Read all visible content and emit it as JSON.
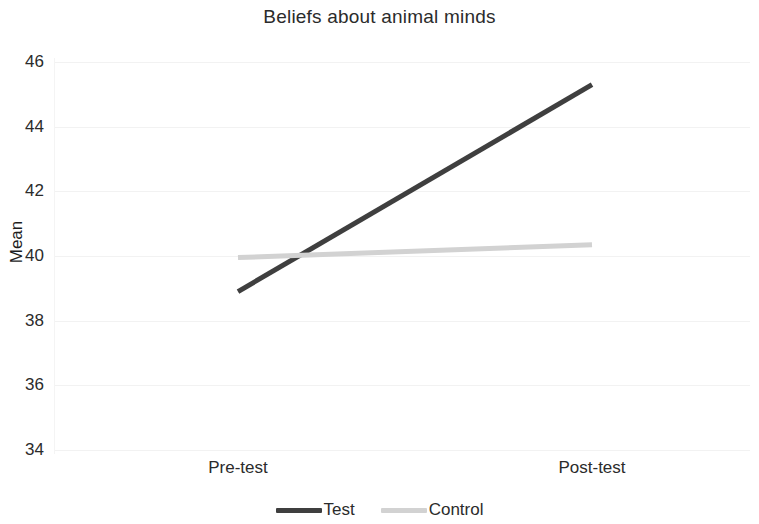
{
  "chart_data": {
    "type": "line",
    "title": "Beliefs about animal minds",
    "xlabel": "",
    "ylabel": "Mean",
    "categories": [
      "Pre-test",
      "Post-test"
    ],
    "series": [
      {
        "name": "Test",
        "values": [
          38.9,
          45.3
        ],
        "color": "#3f3f3f"
      },
      {
        "name": "Control",
        "values": [
          39.95,
          40.35
        ],
        "color": "#d2d2d2"
      }
    ],
    "ylim": [
      34,
      46
    ],
    "yticks": [
      46,
      44,
      42,
      40,
      38,
      36,
      34
    ],
    "grid": true,
    "legend_position": "bottom"
  },
  "legend": {
    "entries": [
      {
        "label": "Test",
        "color": "#3f3f3f"
      },
      {
        "label": "Control",
        "color": "#d2d2d2"
      }
    ]
  },
  "colors": {
    "test_line": "#3f3f3f",
    "control_line": "#d2d2d2",
    "gridline": "#f2f2f2",
    "text": "#2b2b2b",
    "background": "#ffffff"
  }
}
